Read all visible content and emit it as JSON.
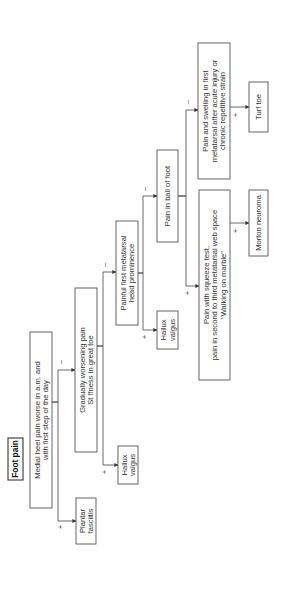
{
  "diagram": {
    "title": "Foot pain",
    "orientation": "rotated 90 degrees counter-clockwise",
    "nodes": {
      "root": {
        "lines": [
          "Foot pain"
        ]
      },
      "heel": {
        "lines": [
          "Medial heel pain worse in a.m. and",
          "with first step of the day"
        ]
      },
      "plantar": {
        "lines": [
          "Plantar",
          "fasciitis"
        ]
      },
      "gradual": {
        "lines": [
          "Gradually worsening pain",
          "St ffness in great toe"
        ]
      },
      "hallux1": {
        "lines": [
          "Hallux",
          "valgus"
        ]
      },
      "painful": {
        "lines": [
          "Painful first metatarsal",
          "head prominence"
        ]
      },
      "hallux2": {
        "lines": [
          "Hallux",
          "valgus"
        ]
      },
      "ball": {
        "lines": [
          "Pain in ball of foot"
        ]
      },
      "squeeze": {
        "lines": [
          "Pain with squeeze test,",
          "pain in second to third metatarsal web space",
          "\"Walking on marble\""
        ]
      },
      "morton": {
        "lines": [
          "Morton neuroma"
        ]
      },
      "swelling": {
        "lines": [
          "Pain and swelling in first",
          "metatarsal after acute injury or",
          "chronic repetitive strain"
        ]
      },
      "turf": {
        "lines": [
          "Turf toe"
        ]
      }
    },
    "edges": [
      {
        "from": "heel",
        "to": "plantar",
        "label": "+"
      },
      {
        "from": "heel",
        "to": "gradual",
        "label": "–"
      },
      {
        "from": "gradual",
        "to": "hallux1",
        "label": "+"
      },
      {
        "from": "gradual",
        "to": "painful",
        "label": "–"
      },
      {
        "from": "painful",
        "to": "hallux2",
        "label": "+"
      },
      {
        "from": "painful",
        "to": "ball",
        "label": "–"
      },
      {
        "from": "ball",
        "to": "squeeze",
        "label": "+"
      },
      {
        "from": "ball",
        "to": "swelling",
        "label": "–"
      },
      {
        "from": "squeeze",
        "to": "morton",
        "label": "+"
      },
      {
        "from": "swelling",
        "to": "turf",
        "label": "+"
      }
    ]
  }
}
